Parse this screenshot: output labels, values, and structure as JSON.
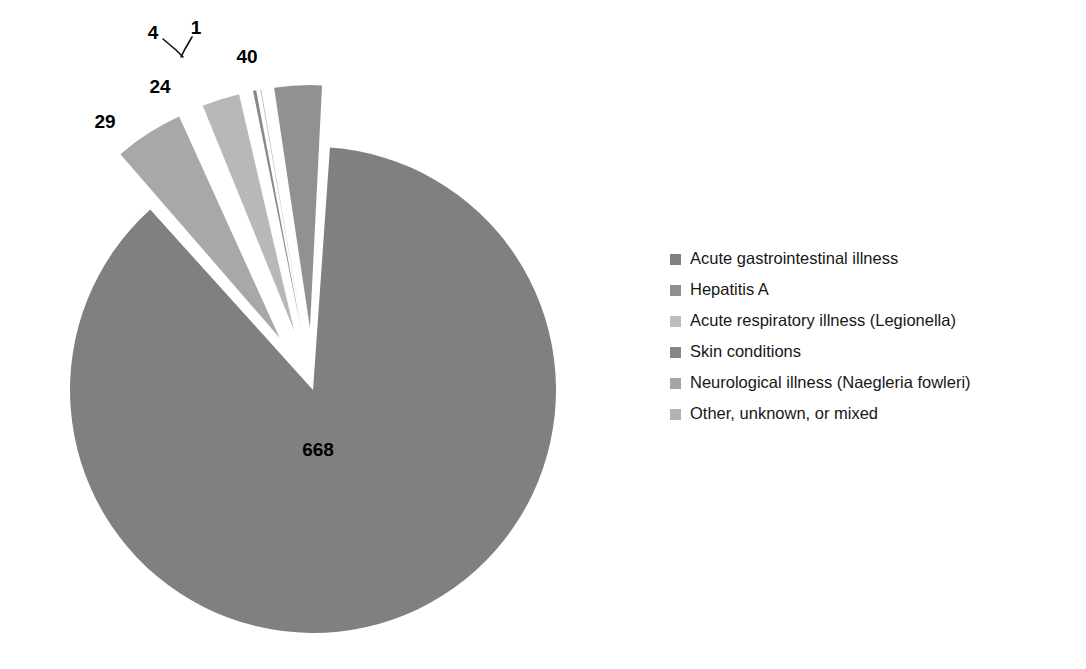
{
  "chart_data": {
    "type": "pie",
    "title": "",
    "subtitle": "",
    "xlabel": "",
    "ylabel": "",
    "legend_position": "right",
    "grid": false,
    "exploded": true,
    "total": 766,
    "categories": [
      "Acute gastrointestinal illness",
      "Hepatitis A",
      "Acute respiratory illness (Legionella)",
      "Skin conditions",
      "Neurological illness (Naegleria fowleri)",
      "Other, unknown, or mixed"
    ],
    "values": [
      668,
      40,
      24,
      4,
      1,
      29
    ],
    "data_labels": [
      "668",
      "40",
      "24",
      "4",
      "1",
      "29"
    ],
    "colors": [
      "#808080",
      "#a8a8a8",
      "#b8b8b8",
      "#8a8a8a",
      "#b0b0b0",
      "#919191"
    ],
    "slices": [
      {
        "label": "Acute gastrointestinal illness",
        "value": 668,
        "data_label": "668",
        "color": "#808080",
        "exploded": false,
        "label_x": 318,
        "label_y": 451
      },
      {
        "label": "Hepatitis A",
        "value": 40,
        "data_label": "40",
        "color": "#a8a8a8",
        "exploded": true,
        "label_x": 247,
        "label_y": 58
      },
      {
        "label": "Acute respiratory illness (Legionella)",
        "value": 24,
        "data_label": "24",
        "color": "#b8b8b8",
        "exploded": true,
        "label_x": 160,
        "label_y": 88
      },
      {
        "label": "Skin conditions",
        "value": 4,
        "data_label": "4",
        "color": "#8a8a8a",
        "exploded": true,
        "label_x": 153,
        "label_y": 34
      },
      {
        "label": "Neurological illness (Naegleria fowleri)",
        "value": 1,
        "data_label": "1",
        "color": "#b0b0b0",
        "exploded": true,
        "label_x": 196,
        "label_y": 29
      },
      {
        "label": "Other, unknown, or mixed",
        "value": 29,
        "data_label": "29",
        "color": "#919191",
        "exploded": true,
        "label_x": 105,
        "label_y": 123
      }
    ]
  },
  "legend": {
    "items": [
      {
        "label": "Acute gastrointestinal illness",
        "color": "#808080"
      },
      {
        "label": "Hepatitis A",
        "color": "#8f8f8f"
      },
      {
        "label": "Acute respiratory illness (Legionella)",
        "color": "#bdbdbd"
      },
      {
        "label": "Skin conditions",
        "color": "#868686"
      },
      {
        "label": "Neurological illness (Naegleria fowleri)",
        "color": "#a5a5a5"
      },
      {
        "label": "Other, unknown, or mixed",
        "color": "#b2b2b2"
      }
    ]
  }
}
